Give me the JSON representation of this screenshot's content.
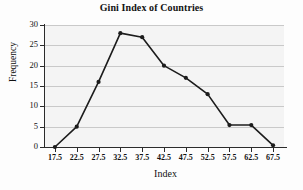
{
  "chart_data": {
    "type": "line",
    "title": "Gini Index of Countries",
    "xlabel": "Index",
    "ylabel": "Frequency",
    "x": [
      17.5,
      22.5,
      27.5,
      32.5,
      37.5,
      42.5,
      47.5,
      52.5,
      57.5,
      62.5,
      67.5
    ],
    "values": [
      0,
      5,
      16,
      28,
      27,
      20,
      17,
      13,
      5.4,
      5.4,
      0.4
    ],
    "xtick_labels": [
      "17.5",
      "22.5",
      "27.5",
      "32.5",
      "37.5",
      "42.5",
      "47.5",
      "52.5",
      "57.5",
      "62.5",
      "67.5"
    ],
    "ytick_labels": [
      "0",
      "5",
      "10",
      "15",
      "20",
      "25",
      "30"
    ],
    "ytick_values": [
      0,
      5,
      10,
      15,
      20,
      25,
      30
    ],
    "xlim": [
      15.0,
      70.0
    ],
    "ylim": [
      0,
      30
    ],
    "grid": true,
    "grid_axis": "y",
    "legend": false,
    "marker": "filled-circle",
    "line_color": "#1c1c1c",
    "marker_color": "#1c1c1c",
    "grid_color": "#c9c9c9",
    "plot_background": "#f4f4f4",
    "axis_color": "#2b2b2b"
  }
}
